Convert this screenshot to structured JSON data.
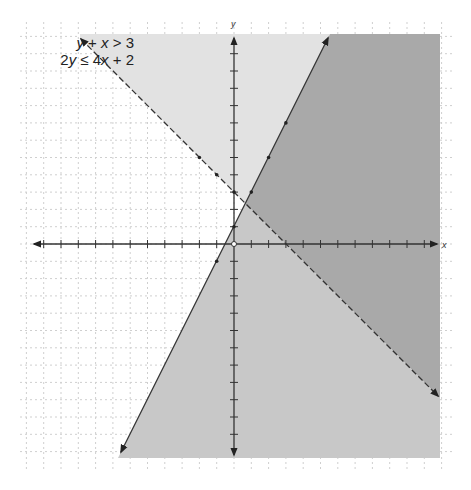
{
  "chart_data": {
    "type": "inequality_graph",
    "title": "",
    "inequalities": [
      {
        "label": "y + x > 3",
        "boundary": "y = -x + 3",
        "line_style": "dashed",
        "shade": "above",
        "points": [
          [
            -2,
            5
          ],
          [
            -1,
            4
          ],
          [
            0,
            3
          ]
        ]
      },
      {
        "label": "2y ≤ 4x + 2",
        "boundary": "y = 2x + 1",
        "line_style": "solid",
        "shade": "below",
        "points": [
          [
            -1,
            -1
          ],
          [
            0,
            1
          ],
          [
            1,
            3
          ],
          [
            2,
            5
          ],
          [
            3,
            7
          ]
        ]
      }
    ],
    "intersection": [
      0.67,
      2.33
    ],
    "xlabel": "x",
    "ylabel": "y",
    "xlim": [
      -12,
      12
    ],
    "ylim": [
      -12,
      12
    ],
    "grid": true,
    "grid_style": "dotted",
    "x_ticks": [
      -11,
      -10,
      -9,
      -8,
      -7,
      -6,
      -5,
      -4,
      -3,
      -2,
      -1,
      1,
      2,
      3,
      4,
      5,
      6,
      7,
      8,
      9,
      10,
      11
    ],
    "y_ticks": [
      -11,
      -10,
      -9,
      -8,
      -7,
      -6,
      -5,
      -4,
      -3,
      -2,
      -1,
      1,
      2,
      3,
      4,
      5,
      6,
      7,
      8,
      9,
      10,
      11
    ],
    "region_colors": {
      "inequality1_only": "#e2e2e2",
      "inequality2_only": "#c8c8c8",
      "solution_overlap": "#a9a9a9"
    }
  },
  "legend": {
    "line1": {
      "a": "y",
      "op1": " + ",
      "b": "x",
      "op2": " > 3"
    },
    "line2": {
      "a": "2",
      "b": "y",
      "op1": " ≤ 4",
      "c": "x",
      "op2": " + 2"
    }
  },
  "axes": {
    "x_label": "x",
    "y_label": "y"
  },
  "colors": {
    "light": "#e2e2e2",
    "mid": "#c8c8c8",
    "dark": "#a9a9a9",
    "line": "#333333",
    "grid": "#cfcfcf"
  }
}
